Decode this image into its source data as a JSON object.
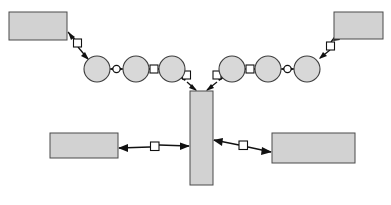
{
  "canvas": {
    "width": 391,
    "height": 205,
    "background": "#ffffff"
  },
  "style": {
    "node_fill": "#d2d2d2",
    "circle_fill": "#d8d8d8",
    "node_stroke": "#4a4a4a",
    "link_stroke": "#111111",
    "marker_fill": "#ffffff"
  },
  "diagram": {
    "title": "",
    "type": "node-link-diagram",
    "rect_nodes": [
      {
        "id": "top-left-rect",
        "label": "",
        "x": 9,
        "y": 12,
        "width": 58,
        "height": 28
      },
      {
        "id": "top-right-rect",
        "label": "",
        "x": 334,
        "y": 12,
        "width": 49,
        "height": 27
      },
      {
        "id": "center-bar",
        "label": "",
        "x": 190,
        "y": 91,
        "width": 23,
        "height": 94
      },
      {
        "id": "bottom-left-rect",
        "label": "",
        "x": 50,
        "y": 133,
        "width": 68,
        "height": 25
      },
      {
        "id": "bottom-right-rect",
        "label": "",
        "x": 272,
        "y": 133,
        "width": 83,
        "height": 30
      }
    ],
    "circle_nodes": [
      {
        "id": "circle-1",
        "label": "",
        "cx": 97,
        "cy": 69,
        "r": 13
      },
      {
        "id": "circle-2",
        "label": "",
        "cx": 136,
        "cy": 69,
        "r": 13
      },
      {
        "id": "circle-3",
        "label": "",
        "cx": 172,
        "cy": 69,
        "r": 13
      },
      {
        "id": "circle-4",
        "label": "",
        "cx": 232,
        "cy": 69,
        "r": 13
      },
      {
        "id": "circle-5",
        "label": "",
        "cx": 268,
        "cy": 69,
        "r": 13
      },
      {
        "id": "circle-6",
        "label": "",
        "cx": 307,
        "cy": 69,
        "r": 13
      }
    ],
    "links": [
      {
        "id": "link-topleft-circle1",
        "from": "top-left-rect",
        "to": "circle-1",
        "marker": "square",
        "marker_x": 78,
        "marker_y": 43,
        "arrows": "both",
        "x1": 68,
        "y1": 32,
        "x2": 88,
        "y2": 59
      },
      {
        "id": "link-circle1-circle2",
        "from": "circle-1",
        "to": "circle-2",
        "marker": "circle",
        "marker_x": 116,
        "marker_y": 69,
        "arrows": "both",
        "x1": 110,
        "y1": 69,
        "x2": 123,
        "y2": 69
      },
      {
        "id": "link-circle2-circle3",
        "from": "circle-2",
        "to": "circle-3",
        "marker": "square",
        "marker_x": 154,
        "marker_y": 69,
        "arrows": "both",
        "x1": 149,
        "y1": 69,
        "x2": 159,
        "y2": 69
      },
      {
        "id": "link-circle3-centerbar",
        "from": "circle-3",
        "to": "center-bar",
        "marker": "square",
        "marker_x": 186,
        "marker_y": 75,
        "arrows": "both",
        "x1": 180,
        "y1": 78,
        "x2": 196,
        "y2": 90
      },
      {
        "id": "link-circle4-centerbar",
        "from": "circle-4",
        "to": "center-bar",
        "marker": "square",
        "marker_x": 217,
        "marker_y": 75,
        "arrows": "both",
        "x1": 224,
        "y1": 78,
        "x2": 207,
        "y2": 90
      },
      {
        "id": "link-circle4-circle5",
        "from": "circle-4",
        "to": "circle-5",
        "marker": "square",
        "marker_x": 250,
        "marker_y": 69,
        "arrows": "both",
        "x1": 245,
        "y1": 69,
        "x2": 255,
        "y2": 69
      },
      {
        "id": "link-circle5-circle6",
        "from": "circle-5",
        "to": "circle-6",
        "marker": "circle",
        "marker_x": 288,
        "marker_y": 69,
        "arrows": "both",
        "x1": 281,
        "y1": 69,
        "x2": 294,
        "y2": 69
      },
      {
        "id": "link-circle6-topright",
        "from": "circle-6",
        "to": "top-right-rect",
        "marker": "square",
        "marker_x": 330,
        "marker_y": 46,
        "arrows": "both",
        "x1": 320,
        "y1": 58,
        "x2": 337,
        "y2": 34
      },
      {
        "id": "link-bottomleft-centerbar",
        "from": "bottom-left-rect",
        "to": "center-bar",
        "marker": "square",
        "marker_x": 154,
        "marker_y": 146,
        "arrows": "both",
        "x1": 119,
        "y1": 148,
        "x2": 189,
        "y2": 146
      },
      {
        "id": "link-centerbar-bottomright",
        "from": "center-bar",
        "to": "bottom-right-rect",
        "marker": "square",
        "marker_x": 243,
        "marker_y": 145,
        "arrows": "both",
        "x1": 214,
        "y1": 140,
        "x2": 271,
        "y2": 152
      }
    ]
  }
}
